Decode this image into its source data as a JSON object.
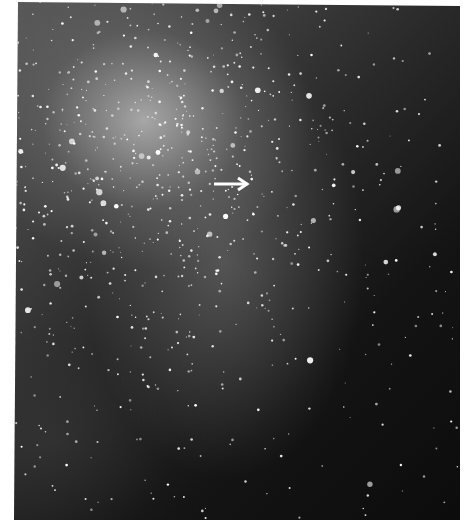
{
  "image": {
    "subject": "star field photograph",
    "annotation": {
      "type": "arrow",
      "direction": "right",
      "target_x": 252,
      "target_y": 184
    },
    "colors": {
      "background": "#ffffff",
      "sky_dark": "#0c0c0c",
      "sky_bright": "#c8c8c8",
      "arrow": "#ffffff"
    }
  }
}
